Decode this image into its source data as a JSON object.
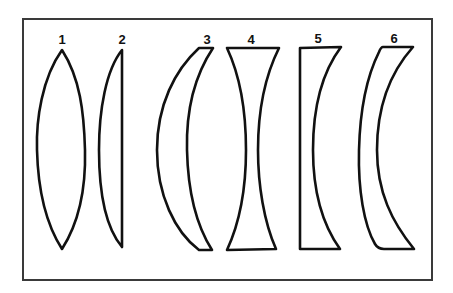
{
  "figure": {
    "colors": {
      "stroke": "#111111",
      "frame": "#3a3a3a",
      "background": "#ffffff"
    },
    "lenses": [
      {
        "id": "1",
        "label": "1",
        "shape": "biconvex"
      },
      {
        "id": "2",
        "label": "2",
        "shape": "plano-convex"
      },
      {
        "id": "3",
        "label": "3",
        "shape": "positive-meniscus"
      },
      {
        "id": "4",
        "label": "4",
        "shape": "biconcave"
      },
      {
        "id": "5",
        "label": "5",
        "shape": "plano-concave"
      },
      {
        "id": "6",
        "label": "6",
        "shape": "negative-meniscus"
      }
    ]
  }
}
